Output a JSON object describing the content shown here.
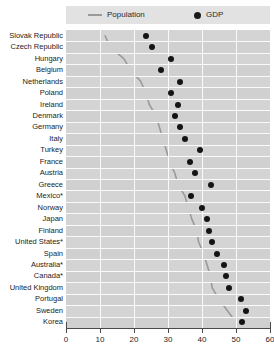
{
  "legend": {
    "population_label": "Population",
    "gdp_label": "GDP",
    "population_color": "#9a9a9a",
    "gdp_color": "#141414"
  },
  "axis": {
    "x_ticks": [
      0,
      10,
      20,
      30,
      40,
      50,
      60
    ],
    "x_min": 0,
    "x_max": 60
  },
  "chart_data": {
    "type": "scatter",
    "title": "",
    "xlabel": "",
    "ylabel": "",
    "xlim": [
      0,
      60
    ],
    "grid": true,
    "legend_position": "top",
    "orientation": "horizontal",
    "categories": [
      "Slovak Republic",
      "Czech Republic",
      "Hungary",
      "Belgium",
      "Netherlands",
      "Poland",
      "Ireland",
      "Denmark",
      "Germany",
      "Italy",
      "Turkey",
      "France",
      "Austria",
      "Greece",
      "Mexico*",
      "Norway",
      "Japan",
      "Finland",
      "United States*",
      "Spain",
      "Australia*",
      "Canada*",
      "United Kingdom",
      "Portugal",
      "Sweden",
      "Korea"
    ],
    "series": [
      {
        "name": "GDP",
        "marker": "dot",
        "color": "#141414",
        "values": [
          23.5,
          25.3,
          30.9,
          27.8,
          33.5,
          31.0,
          32.8,
          32.0,
          33.6,
          35.0,
          39.5,
          36.5,
          38.0,
          42.5,
          36.8,
          40.0,
          41.5,
          42.0,
          43.0,
          44.5,
          46.5,
          47.0,
          48.0,
          51.5,
          53.0,
          51.8
        ]
      },
      {
        "name": "Population",
        "marker": "line",
        "color": "#9a9a9a",
        "values": [
          11.5,
          13.0,
          17.0,
          19.0,
          22.0,
          23.5,
          24.5,
          26.5,
          27.5,
          28.5,
          29.5,
          30.5,
          32.0,
          33.0,
          35.0,
          36.0,
          37.0,
          38.5,
          39.0,
          40.5,
          41.5,
          42.5,
          43.0,
          45.0,
          47.5,
          50.0
        ]
      }
    ]
  }
}
